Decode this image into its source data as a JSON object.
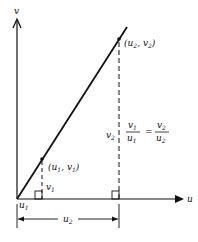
{
  "axes": {
    "x_label": "u",
    "y_label": "v"
  },
  "points": {
    "p1": {
      "label_open": "(",
      "u": "u",
      "u_sub": "1",
      "sep": ", ",
      "v": "v",
      "v_sub": "1",
      "label_close": ")"
    },
    "p2": {
      "label_open": "(",
      "u": "u",
      "u_sub": "2",
      "sep": ", ",
      "v": "v",
      "v_sub": "2",
      "label_close": ")"
    }
  },
  "dimensions": {
    "v1": {
      "sym": "v",
      "sub": "1"
    },
    "v2": {
      "sym": "v",
      "sub": "2"
    },
    "u1": {
      "sym": "u",
      "sub": "1"
    },
    "u2": {
      "sym": "u",
      "sub": "2"
    }
  },
  "equation": {
    "lhs_num": {
      "sym": "v",
      "sub": "1"
    },
    "lhs_den": {
      "sym": "u",
      "sub": "1"
    },
    "equals": "=",
    "rhs_num": {
      "sym": "v",
      "sub": "2"
    },
    "rhs_den": {
      "sym": "u",
      "sub": "2"
    }
  }
}
